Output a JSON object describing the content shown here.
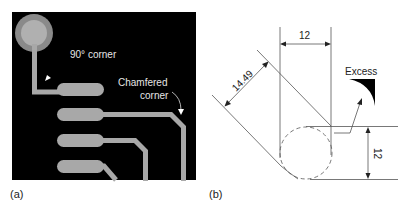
{
  "figure": {
    "panel_a": {
      "label": "(a)",
      "annotation_90": "90° corner",
      "annotation_chamfer_line1": "Chamfered",
      "annotation_chamfer_line2": "corner"
    },
    "panel_b": {
      "label": "(b)",
      "dim_top": "12",
      "dim_diagonal": "14.49",
      "dim_right": "12",
      "excess_label": "Excess"
    }
  },
  "colors": {
    "pcb_background": "#000000",
    "copper": "#a8a8a8",
    "pad_ring": "#8a8a8a",
    "line": "#555555",
    "text": "#222222"
  }
}
